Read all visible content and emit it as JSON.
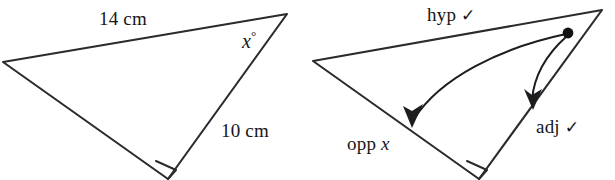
{
  "figure": {
    "background_color": "#ffffff",
    "stroke_color": "#2b2b2f",
    "text_color": "#16161a"
  },
  "left_triangle": {
    "name": "triangle-with-measurements",
    "side_top_label": "14 cm",
    "side_right_label": "10 cm",
    "angle_label": "x",
    "angle_degree_symbol": "°",
    "right_angle_marker": "square",
    "vertices": {
      "left": [
        3,
        62
      ],
      "apex": [
        287,
        14
      ],
      "bottom": [
        168,
        179
      ]
    }
  },
  "right_triangle": {
    "name": "triangle-with-trig-labels",
    "hypotenuse_label": "hyp",
    "hypotenuse_check": "✓",
    "opposite_label": "opp",
    "opposite_variable": "x",
    "adjacent_label": "adj",
    "adjacent_check": "✓",
    "right_angle_marker": "square",
    "vertices": {
      "left": [
        313,
        61
      ],
      "apex": [
        602,
        10
      ],
      "bottom": [
        479,
        179
      ]
    },
    "reference_dot": [
      568,
      33
    ],
    "arrow_to_opposite_tip": [
      412,
      126
    ],
    "arrow_to_adjacent_tip": [
      533,
      108
    ]
  }
}
